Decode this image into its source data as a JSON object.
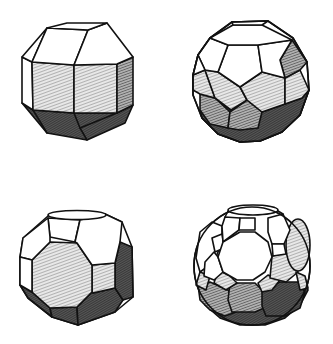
{
  "figure": {
    "background": "#ffffff",
    "stroke_color": "#111111",
    "shading": {
      "light": "#bdbdbd",
      "mid": "#8a8a8a",
      "dark": "#4a4a4a"
    },
    "solids": [
      {
        "position": "top-left",
        "name": "rhombicuboctahedron"
      },
      {
        "position": "top-right",
        "name": "rhombicosidodecahedron"
      },
      {
        "position": "bottom-left",
        "name": "truncated cuboctahedron"
      },
      {
        "position": "bottom-right",
        "name": "truncated icosidodecahedron"
      }
    ]
  }
}
